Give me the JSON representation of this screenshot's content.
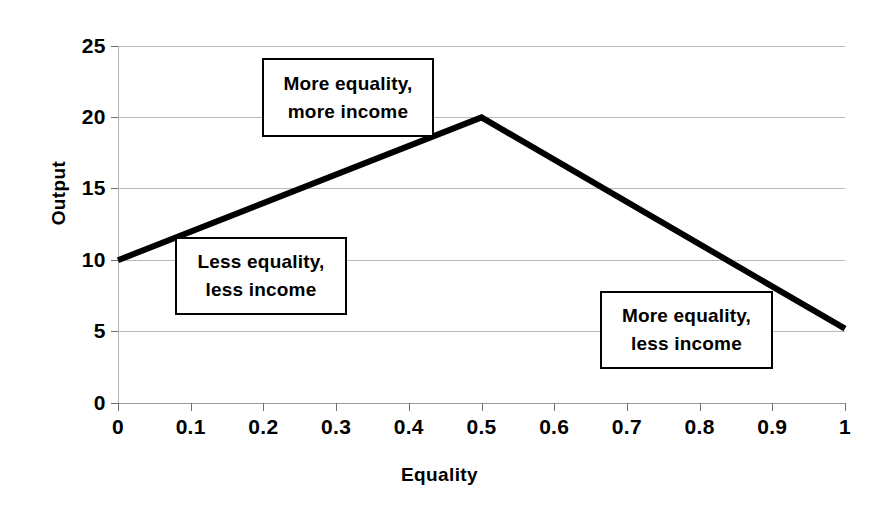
{
  "chart_data": {
    "type": "line",
    "title": "",
    "subtitle": "",
    "xlabel": "Equality",
    "ylabel": "Output",
    "xlim": [
      0,
      1
    ],
    "ylim": [
      0,
      25
    ],
    "grid": true,
    "legend": "none",
    "x_ticks": [
      "0",
      "0.1",
      "0.2",
      "0.3",
      "0.4",
      "0.5",
      "0.6",
      "0.7",
      "0.8",
      "0.9",
      "1"
    ],
    "x_tick_values": [
      0,
      0.1,
      0.2,
      0.3,
      0.4,
      0.5,
      0.6,
      0.7,
      0.8,
      0.9,
      1
    ],
    "y_ticks": [
      "0",
      "5",
      "10",
      "15",
      "20",
      "25"
    ],
    "y_tick_values": [
      0,
      5,
      10,
      15,
      20,
      25
    ],
    "series": [
      {
        "name": "Output",
        "color": "#000000",
        "x": [
          0,
          0.5,
          1
        ],
        "values": [
          10,
          20,
          5.2
        ]
      }
    ],
    "annotations": [
      {
        "id": "more-equality-more-income",
        "line1": "More equality,",
        "line2": "more income",
        "anchor_x": 0.42,
        "anchor_y": 21.5
      },
      {
        "id": "less-equality-less-income",
        "line1": "Less equality,",
        "line2": "less income",
        "anchor_x": 0.21,
        "anchor_y": 9.2
      },
      {
        "id": "more-equality-less-income",
        "line1": "More equality,",
        "line2": "less income",
        "anchor_x": 0.8,
        "anchor_y": 5.4
      }
    ]
  },
  "axes": {
    "y_title": "Output",
    "x_title": "Equality"
  },
  "y_tick_labels": [
    "25",
    "20",
    "15",
    "10",
    "5",
    "0"
  ],
  "x_tick_labels": [
    "0",
    "0.1",
    "0.2",
    "0.3",
    "0.4",
    "0.5",
    "0.6",
    "0.7",
    "0.8",
    "0.9",
    "1"
  ],
  "annotations": {
    "more_more": {
      "line1": "More equality,",
      "line2": "more income"
    },
    "less_less": {
      "line1": "Less equality,",
      "line2": "less income"
    },
    "more_less": {
      "line1": "More equality,",
      "line2": "less income"
    }
  },
  "colors": {
    "curve": "#000000",
    "grid": "#b9b9b9",
    "text": "#000000",
    "background": "#ffffff"
  }
}
